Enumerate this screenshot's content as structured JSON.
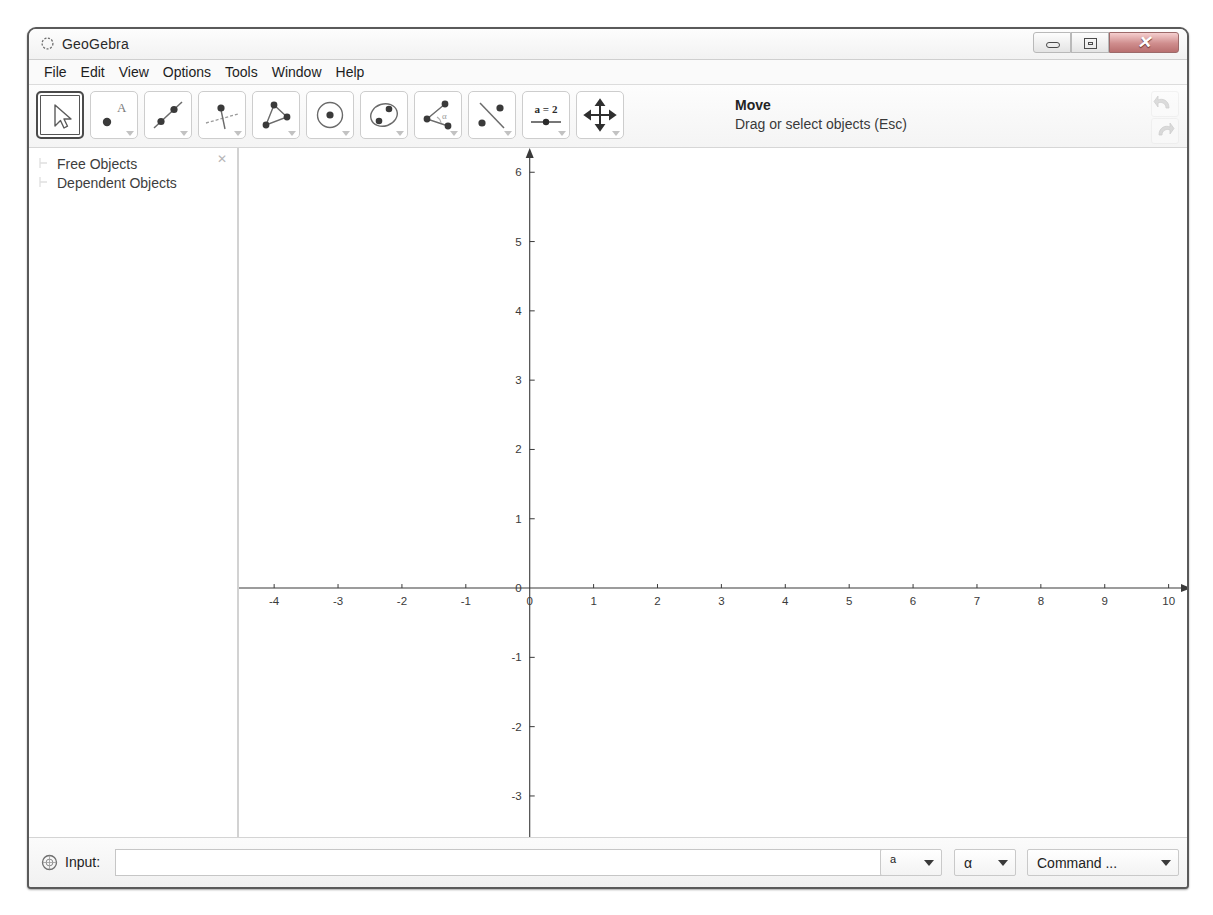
{
  "window": {
    "title": "GeoGebra",
    "app_icon": "geogebra-logo-icon",
    "controls": {
      "minimize": "minimize-button",
      "maximize": "maximize-button",
      "close_glyph": "✕"
    }
  },
  "menubar": {
    "items": [
      {
        "label": "File"
      },
      {
        "label": "Edit"
      },
      {
        "label": "View"
      },
      {
        "label": "Options"
      },
      {
        "label": "Tools"
      },
      {
        "label": "Window"
      },
      {
        "label": "Help"
      }
    ]
  },
  "toolbar": {
    "tools": [
      {
        "name": "move-tool",
        "icon": "arrow-cursor-icon",
        "selected": true,
        "has_caret": false
      },
      {
        "name": "point-tool",
        "icon": "point-with-label-A-icon",
        "selected": false,
        "has_caret": true
      },
      {
        "name": "line-tool",
        "icon": "line-through-two-points-icon",
        "selected": false,
        "has_caret": true
      },
      {
        "name": "perpendicular-line-tool",
        "icon": "perpendicular-line-icon",
        "selected": false,
        "has_caret": true
      },
      {
        "name": "polygon-tool",
        "icon": "triangle-polygon-icon",
        "selected": false,
        "has_caret": true
      },
      {
        "name": "circle-tool",
        "icon": "circle-center-point-icon",
        "selected": false,
        "has_caret": true
      },
      {
        "name": "conic-tool",
        "icon": "ellipse-two-points-icon",
        "selected": false,
        "has_caret": true
      },
      {
        "name": "angle-tool",
        "icon": "angle-alpha-icon",
        "selected": false,
        "has_caret": true
      },
      {
        "name": "reflect-tool",
        "icon": "reflect-about-line-icon",
        "selected": false,
        "has_caret": true
      },
      {
        "name": "slider-tool",
        "icon": "slider-a-equals-2-icon",
        "selected": false,
        "has_caret": true,
        "label": "a = 2"
      },
      {
        "name": "move-graphics-view-tool",
        "icon": "four-way-move-icon",
        "selected": false,
        "has_caret": true
      }
    ],
    "help_title": "Move",
    "help_desc": "Drag or select objects (Esc)",
    "undo_icon": "undo-arrow-icon",
    "redo_icon": "redo-arrow-icon"
  },
  "algebra": {
    "close_glyph": "✕",
    "items": [
      {
        "label": "Free Objects"
      },
      {
        "label": "Dependent Objects"
      }
    ]
  },
  "input": {
    "icon": "geogebra-input-icon",
    "label": "Input:",
    "value": "",
    "placeholder": "",
    "exponent_label": "a",
    "greek_label": "α",
    "command_label": "Command ..."
  },
  "chart_data": {
    "type": "scatter",
    "title": "",
    "xlabel": "",
    "ylabel": "",
    "grid": false,
    "axis_color": "#3a3a3a",
    "xlim": [
      -4.55,
      10.35
    ],
    "ylim": [
      -3.65,
      6.35
    ],
    "x_ticks": [
      -4,
      -3,
      -2,
      -1,
      0,
      1,
      2,
      3,
      4,
      5,
      6,
      7,
      8,
      9,
      10
    ],
    "y_ticks": [
      -3,
      -2,
      -1,
      0,
      1,
      2,
      3,
      4,
      5,
      6
    ],
    "x_tick_labels": [
      "-4",
      "-3",
      "-2",
      "-1",
      "0",
      "1",
      "2",
      "3",
      "4",
      "5",
      "6",
      "7",
      "8",
      "9",
      "10"
    ],
    "y_tick_labels": [
      "-3",
      "-2",
      "-1",
      "0",
      "1",
      "2",
      "3",
      "4",
      "5",
      "6"
    ],
    "origin_label": "0",
    "series": [
      {
        "name": "objects",
        "x": [],
        "y": []
      }
    ]
  }
}
